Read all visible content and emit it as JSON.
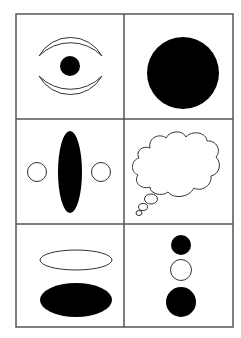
{
  "figure": {
    "width": 241,
    "height": 338,
    "background": "#ffffff",
    "grid": {
      "rows": 3,
      "cols": 2,
      "left": 16,
      "top": 14,
      "right": 233,
      "bottom": 327,
      "col_divider_x": 124,
      "row_divider_y": [
        119,
        224
      ],
      "line_color": "#555555",
      "line_width": 1.5
    },
    "colors": {
      "fill": "#000000",
      "stroke": "#333333",
      "empty": "#ffffff"
    },
    "cells": [
      {
        "id": "cell-1",
        "row": 1,
        "col": 1,
        "content": "eye shape: two outline crescents with a black dot between"
      },
      {
        "id": "cell-2",
        "row": 1,
        "col": 2,
        "content": "large black circle"
      },
      {
        "id": "cell-3",
        "row": 2,
        "col": 1,
        "content": "tall black ellipse flanked by two small outline circles"
      },
      {
        "id": "cell-4",
        "row": 2,
        "col": 2,
        "content": "outline thought bubble"
      },
      {
        "id": "cell-5",
        "row": 3,
        "col": 1,
        "content": "outline ellipse above black ellipse"
      },
      {
        "id": "cell-6",
        "row": 3,
        "col": 2,
        "content": "vertical stack: small black circle, outline circle, larger black circle"
      }
    ]
  }
}
